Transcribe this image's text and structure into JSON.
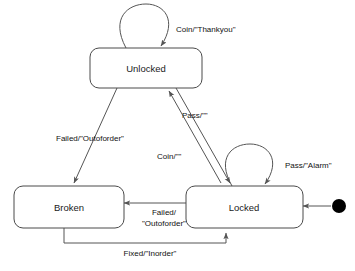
{
  "diagram": {
    "type": "uml-state-machine",
    "title": "",
    "background_color": "#ffffff",
    "stroke_color": "#555555",
    "text_color": "#111111",
    "states": [
      {
        "id": "unlocked",
        "label": "Unlocked",
        "x": 90,
        "y": 48,
        "width": 112,
        "height": 40
      },
      {
        "id": "broken",
        "label": "Broken",
        "x": 14,
        "y": 186,
        "width": 104,
        "height": 42
      },
      {
        "id": "locked",
        "label": "Locked",
        "x": 186,
        "y": 186,
        "width": 110,
        "height": 42
      }
    ],
    "initial_state": {
      "id": "initial-pseudostate",
      "shape": "filled-circle",
      "target": "locked",
      "cx": 339,
      "cy": 206,
      "r": 7,
      "color": "#000000"
    },
    "transitions": [
      {
        "id": "unlocked-self",
        "from": "unlocked",
        "to": "unlocked",
        "kind": "self-loop",
        "label": "Coin/\"Thankyou\"",
        "label_x": 176,
        "label_y": 30,
        "label_anchor": "start"
      },
      {
        "id": "unlocked-to-locked",
        "from": "unlocked",
        "to": "locked",
        "kind": "diagonal",
        "label": "Pass/\"\"",
        "label_x": 182,
        "label_y": 116,
        "label_anchor": "start"
      },
      {
        "id": "locked-to-unlocked",
        "from": "locked",
        "to": "unlocked",
        "kind": "diagonal",
        "label": "Coin/\"\"",
        "label_x": 157,
        "label_y": 157,
        "label_anchor": "start"
      },
      {
        "id": "unlocked-to-broken",
        "from": "unlocked",
        "to": "broken",
        "kind": "diagonal",
        "label": "Failed/\"Outoforder\"",
        "label_x": 56,
        "label_y": 139,
        "label_anchor": "start"
      },
      {
        "id": "locked-self",
        "from": "locked",
        "to": "locked",
        "kind": "self-loop",
        "label": "Pass/\"Alarm\"",
        "label_x": 285,
        "label_y": 166,
        "label_anchor": "start"
      },
      {
        "id": "locked-to-broken",
        "from": "locked",
        "to": "broken",
        "kind": "horizontal",
        "label_line1": "Failed/",
        "label_line2": "\"Outoforder\"",
        "label_x": 164,
        "label_y": 213,
        "label_anchor": "middle"
      },
      {
        "id": "broken-to-locked",
        "from": "broken",
        "to": "locked",
        "kind": "orthogonal-bottom",
        "label": "Fixed/\"Inorder\"",
        "label_x": 150,
        "label_y": 252,
        "label_anchor": "middle"
      }
    ]
  }
}
